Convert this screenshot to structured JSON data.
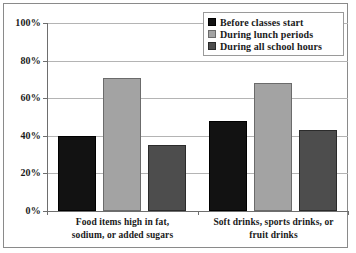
{
  "chart_data": {
    "type": "bar",
    "title": "",
    "subtitle": "",
    "xlabel": "",
    "ylabel": "",
    "ylim": [
      0,
      100
    ],
    "ytick_labels": [
      "100%",
      "80%",
      "60%",
      "40%",
      "20%",
      "0%"
    ],
    "ytick_values": [
      100,
      80,
      60,
      40,
      20,
      0
    ],
    "grid": true,
    "legend_position": "top-right",
    "categories": [
      "Food items high in fat, sodium, or added sugars",
      "Soft drinks, sports drinks, or fruit drinks"
    ],
    "category_lines": [
      [
        "Food items high in fat,",
        "sodium, or added sugars"
      ],
      [
        "Soft drinks, sports drinks, or",
        "fruit drinks"
      ]
    ],
    "series": [
      {
        "name": "Before classes start",
        "color": "#121212",
        "values": [
          40,
          48
        ]
      },
      {
        "name": "During lunch periods",
        "color": "#a3a3a3",
        "values": [
          71,
          68
        ]
      },
      {
        "name": "During all school hours",
        "color": "#4d4d4d",
        "values": [
          35,
          43
        ]
      }
    ]
  },
  "legend": {
    "items": [
      {
        "label": "Before classes start"
      },
      {
        "label": "During lunch periods"
      },
      {
        "label": "During all school hours"
      }
    ]
  },
  "colors": {
    "series_before_classes": "#121212",
    "series_during_lunch": "#a3a3a3",
    "series_all_hours": "#4d4d4d",
    "gridline": "#b4b4b4",
    "axis": "#6e6e6e",
    "frame": "#8a8a8a",
    "text": "#1a1a1a",
    "background": "#ffffff"
  }
}
